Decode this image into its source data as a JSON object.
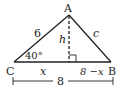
{
  "diagram": {
    "type": "triangle",
    "vertices": {
      "A": {
        "label": "A"
      },
      "B": {
        "label": "B"
      },
      "C": {
        "label": "C"
      }
    },
    "sides": {
      "CA": {
        "label": "6"
      },
      "AB": {
        "label": "c"
      }
    },
    "altitude": {
      "label": "h",
      "style": "dashed",
      "right_angle_marker": true
    },
    "angle_C": {
      "label": "40°"
    },
    "base_segments": {
      "left": "x",
      "right": "8 −x"
    },
    "dimension": {
      "label": "8"
    },
    "colors": {
      "stroke": "#222222",
      "background": "#ffffff"
    }
  }
}
